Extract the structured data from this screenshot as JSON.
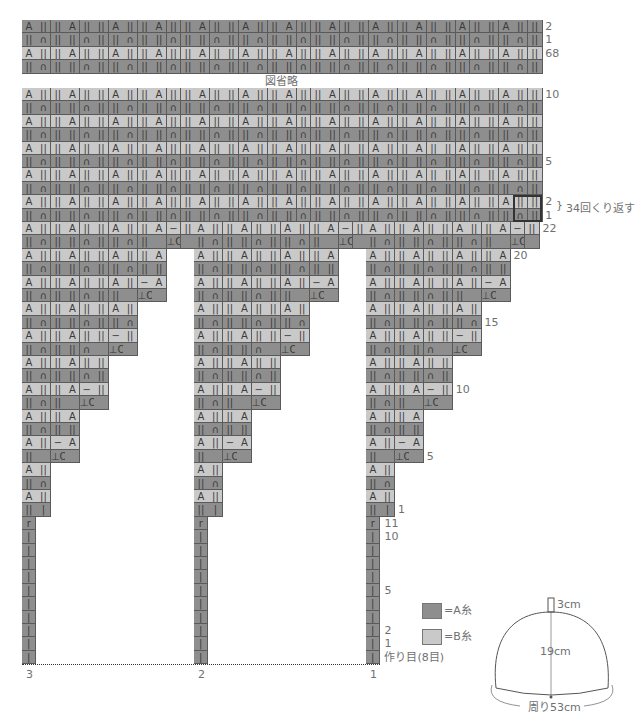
{
  "chart_data": {
    "type": "table",
    "section_columns": 12,
    "sections": 3,
    "section_labels": [
      "3",
      "2",
      "1"
    ],
    "colors": {
      "A": "#8e8e8e",
      "B": "#c9c9c9",
      "grid": "#5a5a5a"
    },
    "top_rows": [
      {
        "label": "2",
        "color": "A",
        "motif": "A"
      },
      {
        "label": "1",
        "color": "A",
        "motif": "n"
      },
      {
        "label": "68",
        "color": "B",
        "motif": "A"
      },
      {
        "label": "",
        "color": "A",
        "motif": "n"
      }
    ],
    "omitted_text": "図省略",
    "body_rows": [
      {
        "label": "10",
        "color": "B",
        "motif": "A"
      },
      {
        "label": "",
        "color": "A",
        "motif": "n"
      },
      {
        "label": "",
        "color": "B",
        "motif": "A"
      },
      {
        "label": "",
        "color": "A",
        "motif": "n"
      },
      {
        "label": "",
        "color": "B",
        "motif": "A"
      },
      {
        "label": "5",
        "color": "A",
        "motif": "n"
      },
      {
        "label": "",
        "color": "B",
        "motif": "A"
      },
      {
        "label": "",
        "color": "A",
        "motif": "n"
      },
      {
        "label": "2",
        "color": "B",
        "motif": "A"
      },
      {
        "label": "1",
        "color": "A",
        "motif": "n"
      }
    ],
    "repeat_note": "34回くり返す",
    "wedge_rows": [
      {
        "label": "22",
        "color": "B",
        "width": 12,
        "motif": "A",
        "dec": true
      },
      {
        "label": "",
        "color": "A",
        "width": 12,
        "motif": "n",
        "inc": true
      },
      {
        "label": "20",
        "color": "B",
        "width": 10,
        "motif": "A"
      },
      {
        "label": "",
        "color": "A",
        "width": 10,
        "motif": "n"
      },
      {
        "label": "",
        "color": "B",
        "width": 10,
        "motif": "A",
        "dec": true
      },
      {
        "label": "",
        "color": "A",
        "width": 10,
        "motif": "n",
        "inc": true
      },
      {
        "label": "",
        "color": "B",
        "width": 8,
        "motif": "A"
      },
      {
        "label": "15",
        "color": "A",
        "width": 8,
        "motif": "n"
      },
      {
        "label": "",
        "color": "B",
        "width": 8,
        "motif": "A",
        "dec": true
      },
      {
        "label": "",
        "color": "A",
        "width": 8,
        "motif": "n",
        "inc": true
      },
      {
        "label": "",
        "color": "B",
        "width": 6,
        "motif": "A"
      },
      {
        "label": "",
        "color": "A",
        "width": 6,
        "motif": "n"
      },
      {
        "label": "10",
        "color": "B",
        "width": 6,
        "motif": "A",
        "dec": true
      },
      {
        "label": "",
        "color": "A",
        "width": 6,
        "motif": "n",
        "inc": true
      },
      {
        "label": "",
        "color": "B",
        "width": 4,
        "motif": "A"
      },
      {
        "label": "",
        "color": "A",
        "width": 4,
        "motif": "n"
      },
      {
        "label": "",
        "color": "B",
        "width": 4,
        "motif": "A",
        "dec": true
      },
      {
        "label": "5",
        "color": "A",
        "width": 4,
        "motif": "n",
        "inc": true
      },
      {
        "label": "",
        "color": "B",
        "width": 2,
        "motif": "A"
      },
      {
        "label": "",
        "color": "A",
        "width": 2,
        "motif": "n"
      },
      {
        "label": "",
        "color": "B",
        "width": 2,
        "motif": "A"
      },
      {
        "label": "1",
        "color": "A",
        "width": 2,
        "motif": "first"
      }
    ],
    "stem_rows": [
      {
        "label": "11",
        "symbol": "r"
      },
      {
        "label": "10",
        "symbol": "|"
      },
      {
        "label": "",
        "symbol": "|"
      },
      {
        "label": "",
        "symbol": "|"
      },
      {
        "label": "",
        "symbol": "|"
      },
      {
        "label": "5",
        "symbol": "|"
      },
      {
        "label": "",
        "symbol": "|"
      },
      {
        "label": "",
        "symbol": "|"
      },
      {
        "label": "2",
        "symbol": "|"
      },
      {
        "label": "1",
        "symbol": "|"
      },
      {
        "label": "作り目(8目)",
        "symbol": "|"
      }
    ]
  },
  "legend": [
    {
      "color": "#8e8e8e",
      "label": "=A糸"
    },
    {
      "color": "#c9c9c9",
      "label": "=B糸"
    }
  ],
  "hat_diagram": {
    "top": "3cm",
    "height": "19cm",
    "circumference": "周り53cm"
  }
}
